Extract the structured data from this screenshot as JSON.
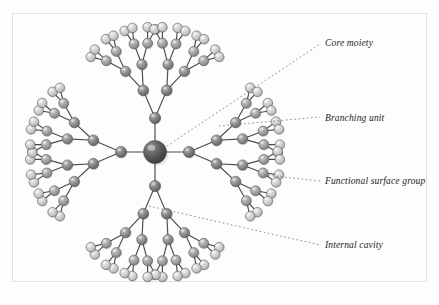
{
  "figure": {
    "kind": "dendrimer-schematic",
    "background_color": "#fdfdfd",
    "frame_color": "#e2e2e2",
    "bond_color": "#4a4a4a"
  },
  "core": {
    "name": "core-moiety-sphere",
    "cx": 155,
    "cy": 152,
    "r": 11.5,
    "fill_light": "#8e8e8e",
    "fill_dark": "#454545"
  },
  "spheres": {
    "generations": [
      {
        "level": 1,
        "r": 5.6,
        "fill_light": "#a9a9a9",
        "fill_dark": "#5e5e5e"
      },
      {
        "level": 2,
        "r": 5.4,
        "fill_light": "#adadad",
        "fill_dark": "#636363"
      },
      {
        "level": 3,
        "r": 5.2,
        "fill_light": "#b4b4b4",
        "fill_dark": "#6e6e6e"
      },
      {
        "level": 4,
        "r": 5.0,
        "fill_light": "#c2c2c2",
        "fill_dark": "#818181"
      },
      {
        "level": 5,
        "r": 4.8,
        "fill_light": "#e0e0e0",
        "fill_dark": "#b0b0b0"
      }
    ]
  },
  "structure": {
    "core_arms": 4,
    "core_arm_angles_deg": [
      -90,
      0,
      90,
      180
    ],
    "branch_factor": 2,
    "generation_count": 5,
    "arm_lengths": [
      34,
      30,
      26,
      22,
      16
    ],
    "spread_angles_deg": [
      0,
      46,
      40,
      36,
      30
    ]
  },
  "labels": {
    "core": "Core moiety",
    "branching": "Branching unit",
    "surface": "Functional surface group",
    "cavity": "Internal cavity"
  },
  "leaders": [
    {
      "name": "leader-core-moiety",
      "from": {
        "x": 167,
        "y": 146
      },
      "to": {
        "x": 320,
        "y": 44
      },
      "label_key": "core"
    },
    {
      "name": "leader-branching-unit",
      "from": {
        "x": 219,
        "y": 126
      },
      "to": {
        "x": 320,
        "y": 117
      },
      "label_key": "branching"
    },
    {
      "name": "leader-functional-surface-group",
      "from": {
        "x": 264,
        "y": 175
      },
      "to": {
        "x": 320,
        "y": 181
      },
      "label_key": "surface"
    },
    {
      "name": "leader-internal-cavity",
      "from": {
        "x": 149,
        "y": 206
      },
      "to": {
        "x": 320,
        "y": 245
      },
      "label_key": "cavity"
    }
  ],
  "leader_style": {
    "color": "#7a6a68",
    "width": 0.8,
    "dash": "1.6 2.6"
  }
}
